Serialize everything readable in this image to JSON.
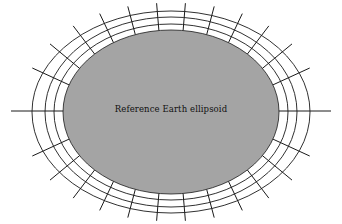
{
  "diagram": {
    "label": "Reference Earth ellipsoid",
    "colors": {
      "ellipsoid_fill": "#a4a4a4",
      "grid_stroke": "#1a1a1a",
      "background": "#ffffff"
    },
    "ellipsoid": {
      "cx": 171,
      "cy": 112,
      "rx": 108,
      "ry": 82
    },
    "rings": [
      {
        "rx": 117,
        "ry": 88
      },
      {
        "rx": 126,
        "ry": 95
      },
      {
        "rx": 139,
        "ry": 101
      }
    ],
    "axis_line": {
      "x1": 11,
      "x2": 331,
      "y": 111
    },
    "spoke_count": 28,
    "spoke_inner_offset": 0,
    "spoke_outer_extent": 1.22
  }
}
